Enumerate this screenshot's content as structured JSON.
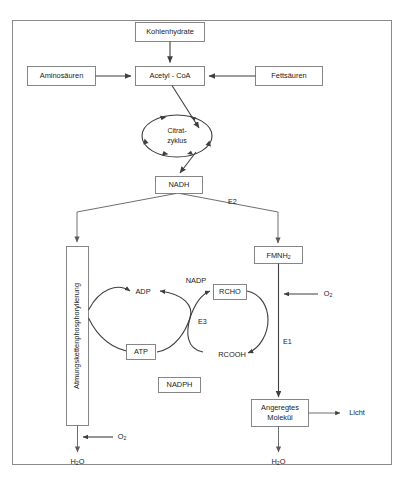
{
  "diagram": {
    "frame": {
      "label": "diagram-frame"
    },
    "nodes": {
      "kohlenhydrate": "Kohlenhydrate",
      "aminosaeuren": "Aminosäuren",
      "fettsaeuren": "Fettsäuren",
      "acetyl_coa": "Acetyl - CoA",
      "citratzyklus_line1": "Citrat-",
      "citratzyklus_line2": "zyklus",
      "nadh": "NADH",
      "atmungskette": "Atmungskettenphosphorylierung",
      "fmnh2_main": "FMNH",
      "fmnh2_sub": "2",
      "adp": "ADP",
      "atp": "ATP",
      "rcho": "RCHO",
      "rcooh": "RCOOH",
      "nadp": "NADP",
      "nadph": "NADPH",
      "angeregtes_line1": "Angeregtes",
      "angeregtes_line2": "Molekül",
      "licht": "Licht"
    },
    "enzymes": {
      "e1": "E1",
      "e2": "E2",
      "e3": "E3"
    },
    "small_molecules": {
      "o2_main": "O",
      "o2_sub": "2",
      "h2o_main": "H",
      "h2o_sub": "2",
      "h2o_tail": "O"
    },
    "colors": {
      "box_stroke": "#7a7a7a",
      "line": "#6e6e6e",
      "line_dark": "#3f3f3f",
      "text": "#1a1a1a",
      "background": "#ffffff"
    }
  }
}
